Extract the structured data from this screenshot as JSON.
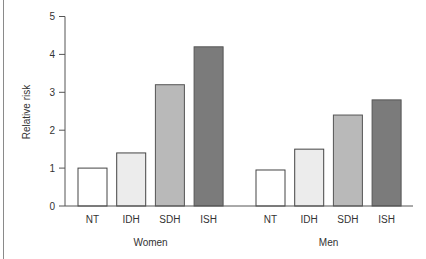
{
  "chart_data": {
    "type": "bar",
    "title": "",
    "xlabel": "",
    "ylabel": "Relative risk",
    "ylim": [
      0,
      5
    ],
    "yticks": [
      0,
      1,
      2,
      3,
      4,
      5
    ],
    "grid": false,
    "legend": "none",
    "groups": [
      {
        "name": "Women",
        "categories": [
          "NT",
          "IDH",
          "SDH",
          "ISH"
        ],
        "values": [
          1.0,
          1.4,
          3.2,
          4.2
        ]
      },
      {
        "name": "Men",
        "categories": [
          "NT",
          "IDH",
          "SDH",
          "ISH"
        ],
        "values": [
          0.95,
          1.5,
          2.4,
          2.8
        ]
      }
    ],
    "category_colors": {
      "NT": "#ffffff",
      "IDH": "#ececec",
      "SDH": "#b9b9b9",
      "ISH": "#7b7b7b"
    },
    "category_edge_colors": {
      "NT": "#444444",
      "IDH": "#444444",
      "SDH": "#555555",
      "ISH": "#555555"
    }
  }
}
